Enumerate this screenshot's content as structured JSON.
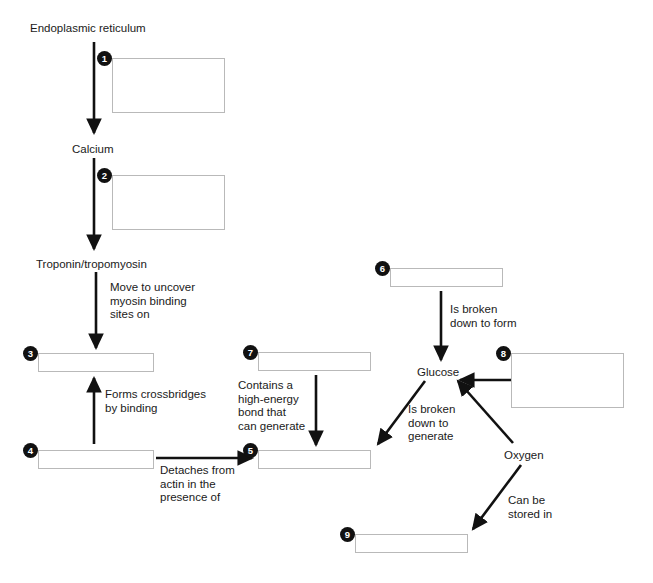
{
  "diagram": {
    "background_color": "#ffffff",
    "line_color": "#111111",
    "blank_border_color": "#b9b9b9",
    "marker_fill": "#111111",
    "marker_text_color": "#ffffff"
  },
  "terms": [
    {
      "id": "endoplasmic-reticulum",
      "label": "Endoplasmic reticulum",
      "x": 30,
      "y": 22
    },
    {
      "id": "calcium",
      "label": "Calcium",
      "x": 72,
      "y": 143
    },
    {
      "id": "troponin-tropomyosin",
      "label": "Troponin/tropomyosin",
      "x": 36,
      "y": 258
    },
    {
      "id": "glucose",
      "label": "Glucose",
      "x": 417,
      "y": 366
    },
    {
      "id": "oxygen",
      "label": "Oxygen",
      "x": 504,
      "y": 449
    }
  ],
  "captions": [
    {
      "id": "move-to-uncover",
      "text": "Move to uncover\nmyosin binding\nsites on",
      "x": 110,
      "y": 281
    },
    {
      "id": "forms-crossbridges",
      "text": "Forms crossbridges\nby binding",
      "x": 105,
      "y": 388
    },
    {
      "id": "detaches-from-actin",
      "text": "Detaches from\nactin in the\npresence of",
      "x": 160,
      "y": 464
    },
    {
      "id": "contains-high-energy-bond",
      "text": "Contains a\nhigh-energy\nbond that\ncan generate",
      "x": 238,
      "y": 379
    },
    {
      "id": "is-broken-down-to-form",
      "text": "Is broken\ndown to form",
      "x": 450,
      "y": 303
    },
    {
      "id": "is-broken-down-to-generate",
      "text": "Is broken\ndown to\ngenerate",
      "x": 408,
      "y": 403
    },
    {
      "id": "can-be-stored-in",
      "text": "Can be\nstored in",
      "x": 508,
      "y": 494
    }
  ],
  "blanks": [
    {
      "number": "1",
      "marker_label": "❶",
      "x": 112,
      "y": 58,
      "width": 113,
      "height": 55,
      "answer": ""
    },
    {
      "number": "2",
      "marker_label": "❷",
      "x": 112,
      "y": 175,
      "width": 113,
      "height": 55,
      "answer": ""
    },
    {
      "number": "3",
      "marker_label": "❸",
      "x": 38,
      "y": 353,
      "width": 116,
      "height": 19,
      "answer": ""
    },
    {
      "number": "4",
      "marker_label": "❹",
      "x": 38,
      "y": 450,
      "width": 116,
      "height": 19,
      "answer": ""
    },
    {
      "number": "5",
      "marker_label": "❺",
      "x": 258,
      "y": 450,
      "width": 113,
      "height": 19,
      "answer": ""
    },
    {
      "number": "6",
      "marker_label": "❻",
      "x": 390,
      "y": 268,
      "width": 113,
      "height": 19,
      "answer": ""
    },
    {
      "number": "7",
      "marker_label": "❼",
      "x": 258,
      "y": 352,
      "width": 113,
      "height": 19,
      "answer": ""
    },
    {
      "number": "8",
      "marker_label": "❽",
      "x": 511,
      "y": 353,
      "width": 113,
      "height": 55,
      "answer": ""
    },
    {
      "number": "9",
      "marker_label": "❾",
      "x": 355,
      "y": 534,
      "width": 113,
      "height": 19,
      "answer": ""
    }
  ],
  "arrows": [
    {
      "id": "er-to-calcium",
      "from": "endoplasmic-reticulum",
      "to": "calcium",
      "x1": 94,
      "y1": 42,
      "x2": 94,
      "y2": 133
    },
    {
      "id": "calcium-to-troponin",
      "from": "calcium",
      "to": "troponin-tropomyosin",
      "x1": 94,
      "y1": 158,
      "x2": 94,
      "y2": 249
    },
    {
      "id": "troponin-to-blank3",
      "from": "troponin-tropomyosin",
      "to": "blank-3",
      "x1": 96,
      "y1": 272,
      "x2": 96,
      "y2": 348
    },
    {
      "id": "blank4-to-blank3",
      "from": "blank-4",
      "to": "blank-3",
      "x1": 94,
      "y1": 444,
      "x2": 94,
      "y2": 378
    },
    {
      "id": "blank4-to-blank5",
      "from": "blank-4",
      "to": "blank-5",
      "x1": 156,
      "y1": 458,
      "x2": 252,
      "y2": 458
    },
    {
      "id": "blank7-to-blank5",
      "from": "blank-7",
      "to": "blank-5",
      "x1": 316,
      "y1": 375,
      "x2": 316,
      "y2": 445
    },
    {
      "id": "blank6-to-glucose",
      "from": "blank-6",
      "to": "glucose",
      "x1": 441,
      "y1": 291,
      "x2": 441,
      "y2": 360
    },
    {
      "id": "glucose-to-blank5",
      "from": "glucose",
      "to": "blank-5",
      "x1": 425,
      "y1": 381,
      "x2": 378,
      "y2": 444
    },
    {
      "id": "oxygen-to-glucose",
      "from": "oxygen",
      "to": "glucose",
      "x1": 513,
      "y1": 443,
      "x2": 458,
      "y2": 381
    },
    {
      "id": "oxygen-to-blank9",
      "from": "oxygen",
      "to": "blank-9",
      "x1": 521,
      "y1": 465,
      "x2": 473,
      "y2": 529
    },
    {
      "id": "blank8-to-glucose",
      "from": "blank-8",
      "to": "glucose",
      "x1": 511,
      "y1": 380,
      "x2": 460,
      "y2": 380
    }
  ]
}
